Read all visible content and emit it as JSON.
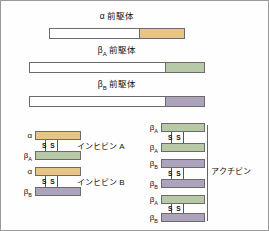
{
  "figure": {
    "title_hidden": "",
    "colors": {
      "alpha_mature": "#E9C488",
      "betaA_mature": "#B7C9A6",
      "betaB_mature": "#ADA3BD",
      "propeptide": "#FFFFFF",
      "outline": "#6B6B6B",
      "background": "#FEFEFE"
    }
  },
  "precursors": [
    {
      "id": "alpha-precursor",
      "label": "α 前駆体",
      "label_main": "α",
      "label_sub": "",
      "label_rest": "前駆体",
      "mature_color": "#E9C488",
      "bar_left": 48,
      "bar_width": 136,
      "mature_width": 44,
      "bar_top": 27,
      "title_top": 10
    },
    {
      "id": "betaA-precursor",
      "label": "βA 前駆体",
      "label_main": "β",
      "label_sub": "A",
      "label_rest": "前駆体",
      "mature_color": "#B7C9A6",
      "bar_left": 28,
      "bar_width": 176,
      "mature_width": 38,
      "bar_top": 61,
      "title_top": 44
    },
    {
      "id": "betaB-precursor",
      "label": "βB 前駆体",
      "label_main": "β",
      "label_sub": "B",
      "label_rest": "前駆体",
      "mature_color": "#ADA3BD",
      "bar_left": 28,
      "bar_width": 176,
      "mature_width": 38,
      "bar_top": 95,
      "title_top": 78
    }
  ],
  "complexes": {
    "ss_label": "S S",
    "inhibins": [
      {
        "id": "inhibin-a",
        "name": "インヒビン A",
        "name_left": 76,
        "name_top": 142,
        "subunits": [
          {
            "sub_main": "α",
            "sub_sub": "",
            "color": "#E9C488",
            "top": 130,
            "left": 34,
            "width": 46
          },
          {
            "sub_main": "β",
            "sub_sub": "A",
            "color": "#B7C9A6",
            "top": 150,
            "left": 34,
            "width": 46
          }
        ],
        "ss_left": 42,
        "ss_top": 141
      },
      {
        "id": "inhibin-b",
        "name": "インヒビン B",
        "name_left": 76,
        "name_top": 178,
        "subunits": [
          {
            "sub_main": "α",
            "sub_sub": "",
            "color": "#E9C488",
            "top": 166,
            "left": 34,
            "width": 46
          },
          {
            "sub_main": "β",
            "sub_sub": "B",
            "color": "#ADA3BD",
            "top": 186,
            "left": 34,
            "width": 46
          }
        ],
        "ss_left": 42,
        "ss_top": 177
      }
    ],
    "activin": {
      "id": "activin",
      "name": "アクチビン",
      "name_left": 208,
      "name_top": 167,
      "pairs": [
        {
          "id": "activin-a",
          "subunits": [
            {
              "sub_main": "β",
              "sub_sub": "A",
              "color": "#B7C9A6",
              "top": 122,
              "left": 160,
              "width": 44
            },
            {
              "sub_main": "β",
              "sub_sub": "A",
              "color": "#B7C9A6",
              "top": 142,
              "left": 160,
              "width": 44
            }
          ],
          "ss_left": 168,
          "ss_top": 133
        },
        {
          "id": "activin-ab",
          "subunits": [
            {
              "sub_main": "β",
              "sub_sub": "B",
              "color": "#ADA3BD",
              "top": 158,
              "left": 160,
              "width": 44
            },
            {
              "sub_main": "β",
              "sub_sub": "B",
              "color": "#ADA3BD",
              "top": 178,
              "left": 160,
              "width": 44
            }
          ],
          "ss_left": 168,
          "ss_top": 169
        },
        {
          "id": "activin-b",
          "subunits": [
            {
              "sub_main": "β",
              "sub_sub": "A",
              "color": "#B7C9A6",
              "top": 194,
              "left": 160,
              "width": 44
            },
            {
              "sub_main": "β",
              "sub_sub": "B",
              "color": "#ADA3BD",
              "top": 212,
              "left": 160,
              "width": 44
            }
          ],
          "ss_left": 168,
          "ss_top": 205
        }
      ]
    }
  }
}
